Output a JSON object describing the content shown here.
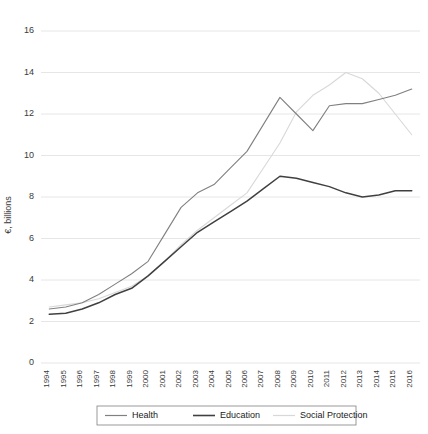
{
  "chart_data": {
    "type": "line",
    "title": "",
    "xlabel": "",
    "ylabel": "€, billions",
    "ylim": [
      0,
      16
    ],
    "yticks": [
      0,
      2,
      4,
      6,
      8,
      10,
      12,
      14,
      16
    ],
    "grid": true,
    "legend_position": "bottom",
    "x": [
      "1994",
      "1995",
      "1996",
      "1997",
      "1998",
      "1999",
      "2000",
      "2001",
      "2002",
      "2003",
      "2004",
      "2005",
      "2006",
      "2007",
      "2008",
      "2009",
      "2010",
      "2011",
      "2012",
      "2013",
      "2014",
      "2015",
      "2016"
    ],
    "series": [
      {
        "name": "Health",
        "color": "#808080",
        "values": [
          2.6,
          2.7,
          2.9,
          3.3,
          3.8,
          4.3,
          4.9,
          6.2,
          7.5,
          8.2,
          8.6,
          9.4,
          10.2,
          11.5,
          12.8,
          12.0,
          11.2,
          12.4,
          12.5,
          12.5,
          12.7,
          12.9,
          13.2
        ]
      },
      {
        "name": "Education",
        "color": "#404040",
        "values": [
          2.35,
          2.4,
          2.6,
          2.9,
          3.3,
          3.6,
          4.2,
          4.9,
          5.6,
          6.3,
          6.8,
          7.3,
          7.8,
          8.4,
          9.0,
          8.9,
          8.7,
          8.5,
          8.2,
          8.0,
          8.1,
          8.3,
          8.3
        ]
      },
      {
        "name": "Social Protection",
        "color": "#d8d8d8",
        "values": [
          2.7,
          2.8,
          2.9,
          3.1,
          3.4,
          3.7,
          4.2,
          4.9,
          5.7,
          6.4,
          7.0,
          7.6,
          8.2,
          9.4,
          10.6,
          12.1,
          12.9,
          13.4,
          14.0,
          13.7,
          13.0,
          12.0,
          11.0
        ]
      }
    ]
  },
  "legend": {
    "items": [
      {
        "label": "Health"
      },
      {
        "label": "Education"
      },
      {
        "label": "Social Protection"
      }
    ]
  }
}
